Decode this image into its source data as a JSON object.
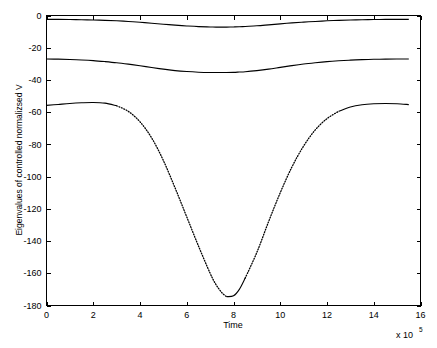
{
  "chart_data": {
    "type": "line",
    "title": "",
    "xlabel": "Time",
    "ylabel": "Eigenvalues of controlled normalizsed V",
    "x_multiplier_base": "x 10",
    "x_multiplier_exponent": "5",
    "xlim": [
      0,
      16
    ],
    "ylim": [
      -180,
      0
    ],
    "xticks": [
      0,
      2,
      4,
      6,
      8,
      10,
      12,
      14,
      16
    ],
    "xticklabels": [
      "0",
      "2",
      "4",
      "6",
      "8",
      "10",
      "12",
      "14",
      "16"
    ],
    "yticks": [
      0,
      -20,
      -40,
      -60,
      -80,
      -100,
      -120,
      -140,
      -160,
      -180
    ],
    "yticklabels": [
      "0",
      "-20",
      "-40",
      "-60",
      "-80",
      "-100",
      "-120",
      "-140",
      "-160",
      "-180"
    ],
    "grid": false,
    "legend": false,
    "legend_position": "none",
    "line_color": "#000000",
    "background_color": "#ffffff",
    "x": [
      0,
      0.5,
      1,
      1.5,
      2,
      2.5,
      3,
      3.5,
      4,
      4.5,
      5,
      5.5,
      6,
      6.5,
      7,
      7.25,
      7.5,
      7.7,
      8,
      8.25,
      8.5,
      9,
      9.5,
      10,
      10.5,
      11,
      11.5,
      12,
      12.5,
      13,
      13.5,
      14,
      14.5,
      15,
      15.5
    ],
    "series": [
      {
        "name": "eigenvalue-1",
        "values": [
          -2.4,
          -2.4,
          -2.5,
          -2.6,
          -2.8,
          -3.0,
          -3.3,
          -3.7,
          -4.2,
          -4.8,
          -5.4,
          -6.0,
          -6.5,
          -6.9,
          -7.1,
          -7.2,
          -7.2,
          -7.2,
          -7.1,
          -7.0,
          -6.8,
          -6.4,
          -5.8,
          -5.2,
          -4.6,
          -4.1,
          -3.7,
          -3.3,
          -3.0,
          -2.8,
          -2.6,
          -2.5,
          -2.4,
          -2.4,
          -2.4
        ]
      },
      {
        "name": "eigenvalue-2",
        "values": [
          -27.0,
          -27.1,
          -27.3,
          -27.6,
          -28.0,
          -28.6,
          -29.3,
          -30.2,
          -31.2,
          -32.3,
          -33.3,
          -34.2,
          -34.8,
          -35.2,
          -35.4,
          -35.4,
          -35.4,
          -35.4,
          -35.3,
          -35.1,
          -34.9,
          -34.2,
          -33.3,
          -32.2,
          -31.1,
          -30.1,
          -29.3,
          -28.6,
          -28.1,
          -27.7,
          -27.4,
          -27.2,
          -27.1,
          -27.0,
          -27.0
        ]
      },
      {
        "name": "eigenvalue-3",
        "values": [
          -55.8,
          -55.2,
          -54.6,
          -54.2,
          -54.0,
          -54.4,
          -56.0,
          -59.5,
          -66.0,
          -76.0,
          -90.0,
          -107.0,
          -125.0,
          -143.0,
          -160.0,
          -167.0,
          -172.0,
          -174.5,
          -174.0,
          -170.0,
          -163.0,
          -147.0,
          -128.0,
          -110.0,
          -94.0,
          -81.0,
          -71.0,
          -64.0,
          -59.5,
          -56.8,
          -55.4,
          -54.8,
          -54.6,
          -54.8,
          -55.3
        ]
      }
    ],
    "series_styles": [
      {
        "name": "eigenvalue-1",
        "style": "solid"
      },
      {
        "name": "eigenvalue-2",
        "style": "solid"
      },
      {
        "name": "eigenvalue-3",
        "style": "solid-with-dotted-descent"
      }
    ],
    "annotations": {
      "minimum_value": -175,
      "minimum_x": 7.7
    }
  }
}
